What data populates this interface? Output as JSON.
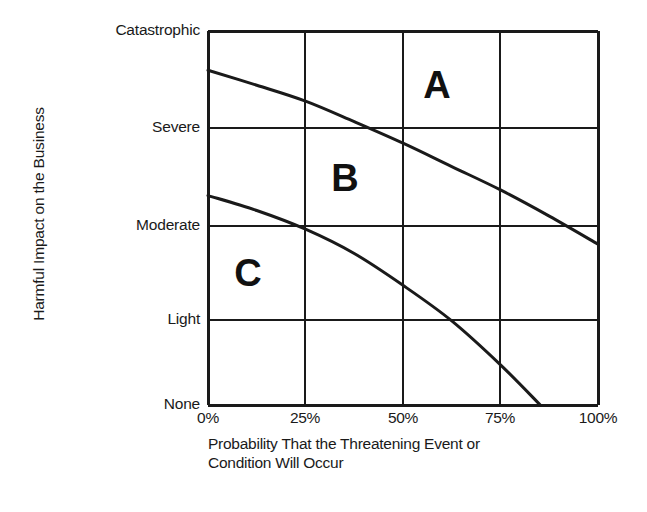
{
  "chart_data": {
    "type": "line",
    "title": "",
    "xlabel": "Probability That the Threatening Event or Condition Will Occur",
    "ylabel": "Harmful Impact on the Business",
    "x_tick_labels": [
      "0%",
      "25%",
      "50%",
      "75%",
      "100%"
    ],
    "x_tick_values": [
      0,
      25,
      50,
      75,
      100
    ],
    "y_tick_labels": [
      "None",
      "Light",
      "Moderate",
      "Severe",
      "Catastrophic"
    ],
    "y_tick_values": [
      0,
      1,
      2,
      3,
      4
    ],
    "xlim": [
      0,
      100
    ],
    "ylim": [
      0,
      4
    ],
    "grid": true,
    "legend": "none",
    "series": [
      {
        "name": "A/B boundary",
        "comment": "upper curve separating zone A from zone B",
        "x": [
          0,
          12.5,
          25,
          37.5,
          50,
          62.5,
          75,
          87.5,
          100
        ],
        "y": [
          3.58,
          3.42,
          3.25,
          3.03,
          2.8,
          2.55,
          2.3,
          2.02,
          1.72
        ]
      },
      {
        "name": "B/C boundary",
        "comment": "lower curve separating zone B from zone C",
        "x": [
          0,
          12.5,
          25,
          37.5,
          50,
          62.5,
          75,
          85.2
        ],
        "y": [
          2.24,
          2.08,
          1.88,
          1.62,
          1.28,
          0.9,
          0.43,
          0.0
        ]
      }
    ],
    "annotations": [
      {
        "label": "A",
        "x": 59,
        "y": 3.42,
        "note": "high-risk zone"
      },
      {
        "label": "B",
        "x": 35,
        "y": 2.43,
        "note": "medium-risk zone"
      },
      {
        "label": "C",
        "x": 10,
        "y": 1.41,
        "note": "low-risk zone"
      }
    ]
  },
  "axes": {
    "y_title": "Harmful Impact on the Business",
    "x_caption_line1": "Probability That the Threatening Event or",
    "x_caption_line2": "Condition Will Occur",
    "y_ticks": [
      {
        "label": "Catastrophic",
        "top": 31
      },
      {
        "label": "Severe",
        "top": 128
      },
      {
        "label": "Moderate",
        "top": 226
      },
      {
        "label": "Light",
        "top": 320
      },
      {
        "label": "None",
        "top": 405
      }
    ],
    "x_ticks": [
      {
        "label": "0%",
        "left": 208
      },
      {
        "label": "25%",
        "left": 305
      },
      {
        "label": "50%",
        "left": 403
      },
      {
        "label": "75%",
        "left": 500
      },
      {
        "label": "100%",
        "left": 598
      }
    ]
  },
  "zones": [
    {
      "label": "A",
      "left": 437,
      "top": 85
    },
    {
      "label": "B",
      "left": 345,
      "top": 178
    },
    {
      "label": "C",
      "left": 248,
      "top": 273
    }
  ],
  "style": {
    "line_color": "#1a1a1a",
    "grid_color": "#1a1a1a",
    "background": "#ffffff"
  }
}
